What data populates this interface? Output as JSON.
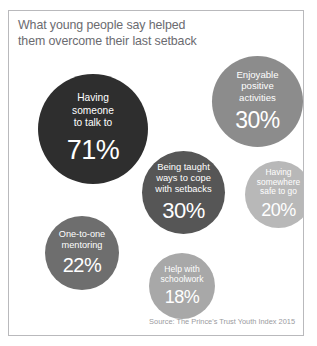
{
  "frame": {
    "border_color": "#b9b9bc",
    "background": "#ffffff"
  },
  "title": {
    "line1": "What young people say helped",
    "line2": "them overcome their last setback",
    "color": "#6b6b70"
  },
  "source": {
    "text": "Source: The Prince's Trust Youth Index 2015",
    "color": "#9a9a9e"
  },
  "chart_data": {
    "type": "bubble",
    "title": "What young people say helped them overcome their last setback",
    "subtitle": "",
    "xlabel": "",
    "ylabel": "",
    "unit": "%",
    "legend_position": "none",
    "grid": false,
    "note": "Bubble area scaled to percentage; darker fill indicates a higher percentage.",
    "categories": [
      "Having someone to talk to",
      "Enjoyable positive activities",
      "Being taught ways to cope with setbacks",
      "One-to-one mentoring",
      "Having somewhere safe to go",
      "Help with schoolwork"
    ],
    "values": [
      71,
      30,
      30,
      22,
      20,
      18
    ],
    "bubbles": [
      {
        "id": "having-someone-to-talk-to",
        "label": "Having\nsomeone\nto talk to",
        "value": 71,
        "value_text": "71%",
        "color": "#2e2e2e",
        "x": 29,
        "y": 63,
        "size": 110,
        "label_font_size": 10.2,
        "label_line_height": 12.6,
        "value_font_size": 27
      },
      {
        "id": "enjoyable-positive-activities",
        "label": "Enjoyable\npositive\nactivities",
        "value": 30,
        "value_text": "30%",
        "color": "#8c8c8c",
        "x": 203,
        "y": 45,
        "size": 91,
        "label_font_size": 9.6,
        "label_line_height": 11.6,
        "value_font_size": 23
      },
      {
        "id": "being-taught-ways-to-cope-with-setbacks",
        "label": "Being taught\nways to cope\nwith setbacks",
        "value": 30,
        "value_text": "30%",
        "color": "#565656",
        "x": 133,
        "y": 140,
        "size": 83,
        "label_font_size": 9.4,
        "label_line_height": 11.2,
        "value_font_size": 22
      },
      {
        "id": "one-to-one-mentoring",
        "label": "One-to-one\nmentoring",
        "value": 22,
        "value_text": "22%",
        "color": "#6e6e6e",
        "x": 36,
        "y": 205,
        "size": 74,
        "label_font_size": 9.2,
        "label_line_height": 11,
        "value_font_size": 20
      },
      {
        "id": "having-somewhere-safe-to-go",
        "label": "Having\nsomewhere\nsafe to go",
        "value": 20,
        "value_text": "20%",
        "color": "#b8b8b8",
        "x": 236,
        "y": 150,
        "size": 67,
        "label_font_size": 8.4,
        "label_line_height": 9.8,
        "value_font_size": 18
      },
      {
        "id": "help-with-schoolwork",
        "label": "Help with\nschoolwork",
        "value": 18,
        "value_text": "18%",
        "color": "#a8a8a8",
        "x": 140,
        "y": 242,
        "size": 66,
        "label_font_size": 8.6,
        "label_line_height": 10.2,
        "value_font_size": 18
      }
    ]
  }
}
